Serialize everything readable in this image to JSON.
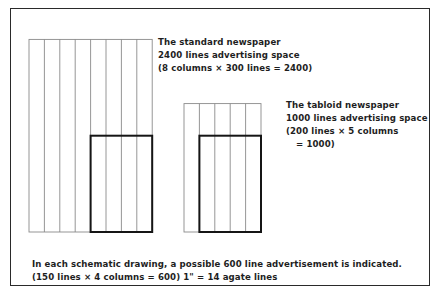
{
  "diagram": {
    "standard": {
      "title": "The standard newspaper",
      "line2": "2400 lines advertising space",
      "line3": "(8 columns × 300 lines = 2400)",
      "columns": 8,
      "total_lines": 300,
      "ad_columns": 4,
      "ad_lines": 150
    },
    "tabloid": {
      "title": "The tabloid newspaper",
      "line2": "1000 lines advertising space",
      "line3": "(200 lines × 5 columns",
      "line4": "= 1000)",
      "columns": 5,
      "total_lines": 200,
      "ad_columns": 4,
      "ad_lines": 150
    },
    "caption": {
      "line1": "In each schematic drawing, a possible 600 line advertisement is indicated.",
      "line2": "(150 lines × 4 columns = 600)   1\" = 14 agate lines"
    }
  }
}
